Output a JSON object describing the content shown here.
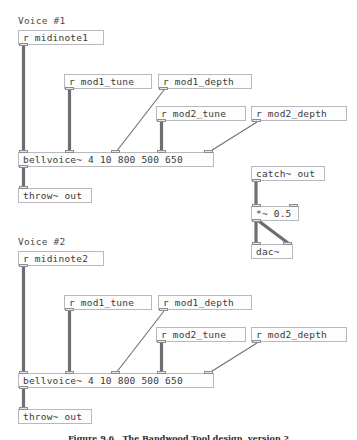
{
  "patch": {
    "title": "Pure Data patch",
    "voices": [
      {
        "comment": "Voice #1",
        "boxes": {
          "midinote": "r midinote1",
          "mod1_tune": "r mod1_tune",
          "mod1_depth": "r mod1_depth",
          "mod2_tune": "r mod2_tune",
          "mod2_depth": "r mod2_depth",
          "bellvoice": "bellvoice~ 4 10 800 500 650",
          "throw": "throw~ out"
        }
      },
      {
        "comment": "Voice #2",
        "boxes": {
          "midinote": "r midinote2",
          "mod1_tune": "r mod1_tune",
          "mod1_depth": "r mod1_depth",
          "mod2_tune": "r mod2_tune",
          "mod2_depth": "r mod2_depth",
          "bellvoice": "bellvoice~ 4 10 800 500 650",
          "throw": "throw~ out"
        }
      }
    ],
    "output_chain": {
      "catch": "catch~ out",
      "gain": "*~ 0.5",
      "dac": "dac~"
    },
    "bellvoice_args": {
      "name": "bellvoice~",
      "values": [
        "4",
        "10",
        "800",
        "500",
        "650"
      ]
    }
  },
  "caption": {
    "text": "Figure 9.6   The Bandwood Tool design, version 2"
  },
  "colors": {
    "box_border": "#b9b9bd",
    "box_fill": "#fdfdfd",
    "text": "#3a3a3a",
    "wire": "#6e6e72",
    "nub_fill": "#e6e6e8",
    "nub_border": "#8e8e92",
    "background": "#ffffff"
  }
}
